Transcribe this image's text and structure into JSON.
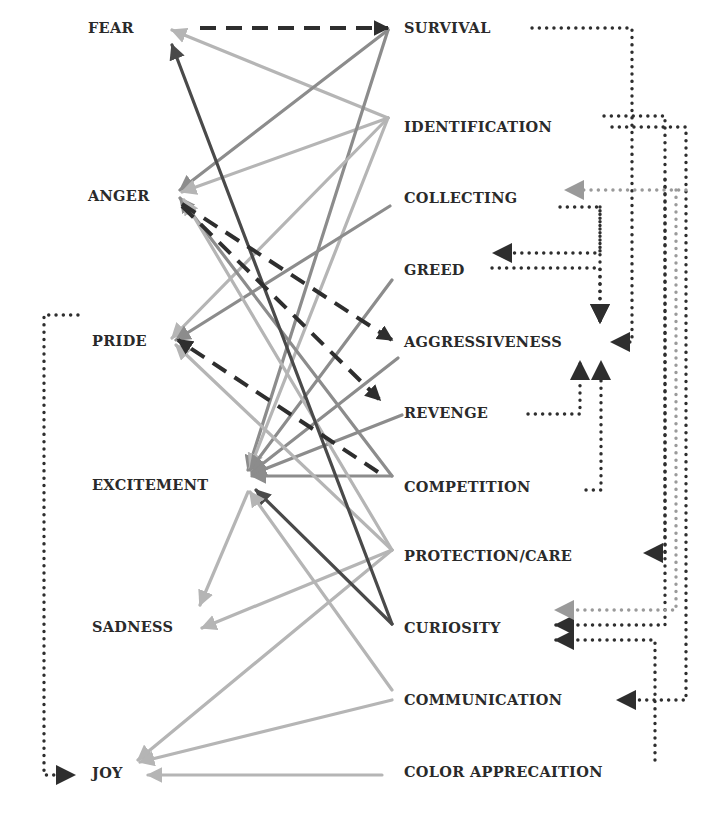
{
  "diagram": {
    "type": "bipartite-flow",
    "colors": {
      "dark": "#4a4a4a",
      "medium": "#8c8c8c",
      "light": "#b5b5b5",
      "dashed": "#2e2e2e",
      "dotted": "#2e2e2e",
      "dotted_light": "#9a9a9a"
    },
    "left_nodes": [
      {
        "id": "fear",
        "label": "FEAR",
        "x": 88,
        "y": 28
      },
      {
        "id": "anger",
        "label": "ANGER",
        "x": 88,
        "y": 196
      },
      {
        "id": "pride",
        "label": "PRIDE",
        "x": 92,
        "y": 341
      },
      {
        "id": "excitement",
        "label": "EXCITEMENT",
        "x": 92,
        "y": 485
      },
      {
        "id": "sadness",
        "label": "SADNESS",
        "x": 92,
        "y": 627
      },
      {
        "id": "joy",
        "label": "JOY",
        "x": 92,
        "y": 773
      }
    ],
    "right_nodes": [
      {
        "id": "survival",
        "label": "SURVIVAL",
        "x": 404,
        "y": 28
      },
      {
        "id": "identification",
        "label": "IDENTIFICATION",
        "x": 404,
        "y": 127
      },
      {
        "id": "collecting",
        "label": "COLLECTING",
        "x": 404,
        "y": 198
      },
      {
        "id": "greed",
        "label": "GREED",
        "x": 404,
        "y": 270
      },
      {
        "id": "aggressiveness",
        "label": "AGGRESSIVENESS",
        "x": 404,
        "y": 342
      },
      {
        "id": "revenge",
        "label": "REVENGE",
        "x": 404,
        "y": 413
      },
      {
        "id": "competition",
        "label": "COMPETITION",
        "x": 404,
        "y": 487
      },
      {
        "id": "protection_care",
        "label": "PROTECTION/CARE",
        "x": 404,
        "y": 556
      },
      {
        "id": "curiosity",
        "label": "CURIOSITY",
        "x": 404,
        "y": 628
      },
      {
        "id": "communication",
        "label": "COMMUNICATION",
        "x": 404,
        "y": 700
      },
      {
        "id": "color_appreciation",
        "label": "COLOR APPRECAITION",
        "x": 404,
        "y": 772
      }
    ],
    "solid_edges": [
      {
        "from": "identification",
        "to": "fear",
        "color": "light",
        "points": [
          [
            388,
            118
          ],
          [
            172,
            30
          ]
        ]
      },
      {
        "from": "survival",
        "to": "anger",
        "color": "medium",
        "points": [
          [
            388,
            30
          ],
          [
            180,
            190
          ]
        ]
      },
      {
        "from": "identification",
        "to": "anger",
        "color": "light",
        "points": [
          [
            388,
            118
          ],
          [
            182,
            192
          ]
        ]
      },
      {
        "from": "survival",
        "to": "excitement",
        "color": "medium",
        "points": [
          [
            388,
            30
          ],
          [
            248,
            470
          ]
        ]
      },
      {
        "from": "identification",
        "to": "excitement",
        "color": "light",
        "points": [
          [
            388,
            118
          ],
          [
            250,
            468
          ]
        ]
      },
      {
        "from": "identification",
        "to": "pride",
        "color": "light",
        "points": [
          [
            388,
            118
          ],
          [
            172,
            338
          ]
        ]
      },
      {
        "from": "collecting",
        "to": "pride",
        "color": "medium",
        "points": [
          [
            390,
            206
          ],
          [
            176,
            340
          ]
        ]
      },
      {
        "from": "greed",
        "to": "excitement",
        "color": "medium",
        "points": [
          [
            392,
            280
          ],
          [
            250,
            470
          ]
        ]
      },
      {
        "from": "aggressiveness",
        "to": "excitement",
        "color": "medium",
        "points": [
          [
            398,
            358
          ],
          [
            252,
            472
          ]
        ]
      },
      {
        "from": "revenge",
        "to": "excitement",
        "color": "medium",
        "points": [
          [
            402,
            415
          ],
          [
            252,
            474
          ]
        ]
      },
      {
        "from": "competition",
        "to": "excitement",
        "color": "medium",
        "points": [
          [
            392,
            476
          ],
          [
            252,
            476
          ]
        ]
      },
      {
        "from": "competition",
        "to": "anger",
        "color": "medium",
        "points": [
          [
            392,
            476
          ],
          [
            180,
            198
          ]
        ]
      },
      {
        "from": "protection_care",
        "to": "anger",
        "color": "light",
        "points": [
          [
            392,
            550
          ],
          [
            184,
            200
          ]
        ]
      },
      {
        "from": "protection_care",
        "to": "pride",
        "color": "light",
        "points": [
          [
            392,
            550
          ],
          [
            176,
            345
          ]
        ]
      },
      {
        "from": "protection_care",
        "to": "sadness",
        "color": "light",
        "points": [
          [
            392,
            550
          ],
          [
            202,
            628
          ]
        ]
      },
      {
        "from": "protection_care",
        "to": "joy",
        "color": "light",
        "points": [
          [
            392,
            550
          ],
          [
            138,
            760
          ]
        ]
      },
      {
        "from": "curiosity",
        "to": "fear",
        "color": "dark",
        "points": [
          [
            392,
            624
          ],
          [
            172,
            45
          ]
        ]
      },
      {
        "from": "curiosity",
        "to": "excitement",
        "color": "dark",
        "points": [
          [
            392,
            624
          ],
          [
            256,
            490
          ]
        ]
      },
      {
        "from": "communication",
        "to": "excitement",
        "color": "light",
        "points": [
          [
            392,
            690
          ],
          [
            250,
            492
          ]
        ]
      },
      {
        "from": "communication",
        "to": "joy",
        "color": "light",
        "points": [
          [
            392,
            700
          ],
          [
            140,
            762
          ]
        ]
      },
      {
        "from": "excitement",
        "to": "sadness",
        "color": "light",
        "points": [
          [
            248,
            492
          ],
          [
            200,
            605
          ]
        ]
      },
      {
        "from": "color_appreciation",
        "to": "joy",
        "color": "light",
        "points": [
          [
            382,
            775
          ],
          [
            148,
            775
          ]
        ]
      }
    ],
    "dashed_edges": [
      {
        "from": "fear",
        "to": "survival",
        "points": [
          [
            200,
            28
          ],
          [
            388,
            28
          ]
        ]
      },
      {
        "from": "anger",
        "to": "aggressiveness",
        "points": [
          [
            182,
            204
          ],
          [
            392,
            340
          ]
        ]
      },
      {
        "from": "anger",
        "to": "revenge",
        "points": [
          [
            182,
            206
          ],
          [
            380,
            400
          ]
        ]
      },
      {
        "from": "competition",
        "to": "pride",
        "points": [
          [
            378,
            472
          ],
          [
            178,
            340
          ]
        ]
      }
    ],
    "dotted_edges": [
      {
        "from": "survival",
        "to": "aggressiveness",
        "color": "dotted",
        "points": [
          [
            532,
            28
          ],
          [
            632,
            28
          ],
          [
            632,
            342
          ],
          [
            612,
            342
          ]
        ]
      },
      {
        "from": "collecting",
        "to": "aggressiveness",
        "color": "dotted",
        "points": [
          [
            560,
            207
          ],
          [
            600,
            207
          ],
          [
            600,
            322
          ]
        ]
      },
      {
        "from": "collecting",
        "to": "greed",
        "color": "dotted",
        "points": [
          [
            600,
            207
          ],
          [
            600,
            253
          ],
          [
            494,
            253
          ]
        ]
      },
      {
        "from": "greed",
        "to": "aggressiveness",
        "color": "dotted",
        "points": [
          [
            492,
            268
          ],
          [
            600,
            268
          ],
          [
            600,
            322
          ]
        ]
      },
      {
        "from": "revenge",
        "to": "aggressiveness",
        "color": "dotted",
        "points": [
          [
            528,
            414
          ],
          [
            580,
            414
          ],
          [
            580,
            362
          ]
        ]
      },
      {
        "from": "competition",
        "to": "aggressiveness",
        "color": "dotted",
        "points": [
          [
            586,
            490
          ],
          [
            601,
            490
          ],
          [
            601,
            362
          ]
        ]
      },
      {
        "from": "identification_loop",
        "to": "identification",
        "color": "dotted",
        "points": [
          [
            604,
            116
          ],
          [
            665,
            116
          ],
          [
            665,
            625
          ],
          [
            556,
            625
          ]
        ]
      },
      {
        "from": "identification",
        "to": "communication",
        "color": "dotted",
        "points": [
          [
            612,
            127
          ],
          [
            686,
            127
          ],
          [
            686,
            700
          ],
          [
            618,
            700
          ]
        ]
      },
      {
        "from": "identification",
        "to": "protection_care",
        "color": "dotted",
        "points": [
          [
            665,
            180
          ],
          [
            665,
            553
          ],
          [
            645,
            553
          ]
        ]
      },
      {
        "from": "collecting_loop",
        "to": "collecting",
        "color": "dotted_light",
        "points": [
          [
            676,
            190
          ],
          [
            676,
            610
          ],
          [
            556,
            610
          ]
        ]
      },
      {
        "from": "collecting",
        "to": "collecting",
        "color": "dotted_light",
        "points": [
          [
            686,
            190
          ],
          [
            566,
            190
          ]
        ]
      },
      {
        "from": "color_appreciation",
        "to": "curiosity",
        "color": "dotted",
        "points": [
          [
            655,
            760
          ],
          [
            655,
            640
          ],
          [
            556,
            640
          ]
        ]
      },
      {
        "from": "pride",
        "to": "joy",
        "color": "dotted",
        "points": [
          [
            78,
            315
          ],
          [
            44,
            315
          ],
          [
            44,
            775
          ],
          [
            74,
            775
          ]
        ]
      }
    ]
  }
}
